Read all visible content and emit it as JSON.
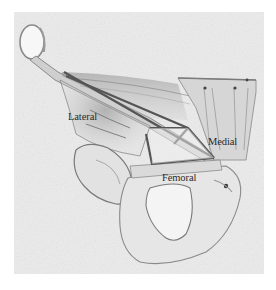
{
  "figure": {
    "type": "anatomical-illustration",
    "labels": {
      "lateral": "Lateral",
      "medial": "Medial",
      "femoral": "Femoral"
    },
    "colors": {
      "background": "#ffffff",
      "paper": "#ececec",
      "shading": "#bdbdbd",
      "outline": "#6e6e6e",
      "triangle_lines": "#555555",
      "label_text": "#2a2a2a"
    }
  }
}
